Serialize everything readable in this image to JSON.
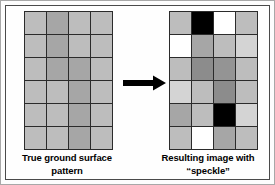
{
  "figure": {
    "arrow": {
      "icon": "right-arrow-icon",
      "direction": "right",
      "color": "#000000"
    }
  },
  "palette": {
    "black": "#000000",
    "dark_gray": "#8c8c8c",
    "medium_gray": "#a6a6a6",
    "light_gray": "#bdbdbd",
    "pale_gray": "#d4d4d4",
    "white": "#ffffff",
    "grid_line": "#2b2b2b",
    "frame": "#4a4a4a"
  },
  "panels": [
    {
      "id": "true-ground-surface",
      "caption_lines": [
        "True ground surface",
        "pattern"
      ],
      "grid": {
        "rows": 6,
        "cols": 4,
        "cells": [
          [
            "#bdbdbd",
            "#a6a6a6",
            "#bdbdbd",
            "#bdbdbd"
          ],
          [
            "#bdbdbd",
            "#a6a6a6",
            "#bdbdbd",
            "#bdbdbd"
          ],
          [
            "#bdbdbd",
            "#a6a6a6",
            "#a6a6a6",
            "#bdbdbd"
          ],
          [
            "#bdbdbd",
            "#bdbdbd",
            "#a6a6a6",
            "#bdbdbd"
          ],
          [
            "#bdbdbd",
            "#bdbdbd",
            "#a6a6a6",
            "#bdbdbd"
          ],
          [
            "#bdbdbd",
            "#bdbdbd",
            "#a6a6a6",
            "#bdbdbd"
          ]
        ]
      }
    },
    {
      "id": "resulting-image-with-speckle",
      "caption_lines": [
        "Resulting image with",
        "“speckle”"
      ],
      "grid": {
        "rows": 6,
        "cols": 4,
        "cells": [
          [
            "#bdbdbd",
            "#000000",
            "#ffffff",
            "#bdbdbd"
          ],
          [
            "#ffffff",
            "#a6a6a6",
            "#bdbdbd",
            "#d4d4d4"
          ],
          [
            "#bdbdbd",
            "#8c8c8c",
            "#949494",
            "#bdbdbd"
          ],
          [
            "#d4d4d4",
            "#bdbdbd",
            "#8c8c8c",
            "#bdbdbd"
          ],
          [
            "#a6a6a6",
            "#bdbdbd",
            "#000000",
            "#d4d4d4"
          ],
          [
            "#bdbdbd",
            "#ffffff",
            "#a6a6a6",
            "#bdbdbd"
          ]
        ]
      }
    }
  ]
}
